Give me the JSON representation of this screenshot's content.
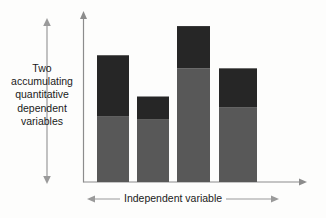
{
  "chart_data": {
    "type": "bar",
    "stacked": true,
    "title": "",
    "subtitle": "",
    "xlabel": "Independent variable",
    "ylabel": "Two accumulating quantitative dependent variables",
    "categories": [
      "1",
      "2",
      "3",
      "4"
    ],
    "series": [
      {
        "name": "lower-segment",
        "color": "#585858",
        "values": [
          65,
          62,
          113,
          74
        ]
      },
      {
        "name": "upper-segment",
        "color": "#262626",
        "values": [
          61,
          23,
          42,
          39
        ]
      }
    ],
    "totals": [
      126,
      85,
      155,
      113
    ],
    "ylim": [
      0,
      170
    ],
    "xlim": [
      0,
      4
    ],
    "grid": false,
    "legend": null,
    "tick_labels_x": [],
    "tick_labels_y": [],
    "annotations": [
      {
        "name": "y-range-arrow",
        "type": "double-arrow",
        "orientation": "vertical"
      },
      {
        "name": "x-range-arrow",
        "type": "double-arrow",
        "orientation": "horizontal"
      }
    ]
  },
  "axes": {
    "y_label_text": "Two accumulating quantitative dependent variables",
    "x_label_text": "Independent variable"
  },
  "colors": {
    "background": "#fdfdfc",
    "axis_line": "#8c8c8c",
    "arrow_line": "#9a9a9a",
    "segment_lower": "#585858",
    "segment_upper": "#262626",
    "text": "#1a1a1a"
  }
}
